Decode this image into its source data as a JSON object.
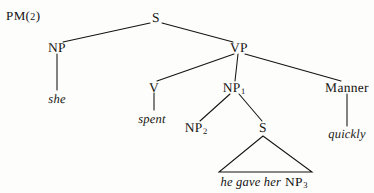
{
  "figure": {
    "tag_main": "PM",
    "tag_paren_open": "(",
    "tag_number": "2",
    "tag_paren_close": ")",
    "tag_full": "PM(2)"
  },
  "diagram": {
    "type": "syntax-tree",
    "background_color": "#fdfdfc",
    "ink_color": "#15130f"
  },
  "nodes": {
    "s_root": {
      "label": "S",
      "subscript": "",
      "x": 156,
      "y": 18
    },
    "np_subject": {
      "label": "NP",
      "subscript": "",
      "x": 57,
      "y": 48
    },
    "vp": {
      "label": "VP",
      "subscript": "",
      "x": 239,
      "y": 48
    },
    "v": {
      "label": "V",
      "subscript": "",
      "x": 154,
      "y": 88
    },
    "np1": {
      "label": "NP",
      "subscript": "1",
      "x": 234,
      "y": 88
    },
    "manner": {
      "label": "Manner",
      "subscript": "",
      "x": 347,
      "y": 88
    },
    "np2": {
      "label": "NP",
      "subscript": "2",
      "x": 196,
      "y": 128
    },
    "s_embedded": {
      "label": "S",
      "subscript": "",
      "x": 263,
      "y": 128
    }
  },
  "terminals": {
    "she": {
      "text": "she",
      "x": 57,
      "y": 100
    },
    "spent": {
      "text": "spent",
      "x": 152,
      "y": 120
    },
    "quickly": {
      "text": "quickly",
      "x": 347,
      "y": 135
    },
    "embedded_phrase_italic": {
      "text": "he gave her",
      "x": 222,
      "y": 178
    },
    "embedded_phrase_np": {
      "label": "NP",
      "subscript": "3",
      "x": 290,
      "y": 178
    }
  },
  "triangle": {
    "apex_x": 263,
    "apex_y": 136,
    "left_x": 219,
    "right_x": 312,
    "base_y": 172
  }
}
